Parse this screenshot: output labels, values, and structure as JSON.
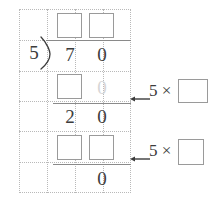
{
  "worksheet": {
    "type": "long-division",
    "dividend": "70",
    "divisor": "5",
    "colors": {
      "ink": "#3c3c3c",
      "faded_ink": "#d6d6d6",
      "box_border": "#9a9a9a",
      "rule": "#8a8a8a",
      "grid_dot": "#b9b9b9",
      "paper": "#ffffff"
    }
  },
  "quotient_row": {
    "tens_box": "",
    "ones_box": ""
  },
  "dividend_row": {
    "divisor": "5",
    "tens": "7",
    "ones": "0"
  },
  "subtract_row_1": {
    "tens_box": "",
    "ones": "0"
  },
  "remainder_row_1": {
    "tens": "2",
    "ones": "0"
  },
  "subtract_row_2": {
    "tens_box": "",
    "ones_box": ""
  },
  "remainder_row_2": {
    "ones": "0"
  },
  "hints": [
    {
      "arrow": "left-arrow",
      "label": "5 ×",
      "multiplicand": "5",
      "operator": "×",
      "answer_box": ""
    },
    {
      "arrow": "left-arrow",
      "label": "5 ×",
      "multiplicand": "5",
      "operator": "×",
      "answer_box": ""
    }
  ]
}
